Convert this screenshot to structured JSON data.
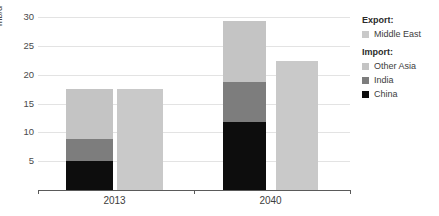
{
  "chart_data": {
    "type": "bar",
    "title": "",
    "subtitle": "",
    "xlabel": "",
    "ylabel": "mb/d",
    "ylim": [
      0,
      30
    ],
    "ytick_labels": [
      "5",
      "10",
      "15",
      "20",
      "25",
      "30"
    ],
    "ytick_values": [
      5,
      10,
      15,
      20,
      25,
      30
    ],
    "grid": true,
    "stacked": true,
    "legend_position": "right",
    "categories": [
      "2013",
      "2040"
    ],
    "groups": [
      {
        "category": "2013",
        "bars": [
          {
            "name": "Import",
            "stacked": true,
            "total": 17.5,
            "segments": [
              {
                "name": "China",
                "value": 5.0,
                "color": "#0d0d0d"
              },
              {
                "name": "India",
                "value": 3.8,
                "color": "#7d7d7d"
              },
              {
                "name": "Other Asia",
                "value": 8.7,
                "color": "#c4c4c4"
              }
            ]
          },
          {
            "name": "Export",
            "stacked": false,
            "total": 17.6,
            "segments": [
              {
                "name": "Middle East",
                "value": 17.6,
                "color": "#c9c9c9"
              }
            ]
          }
        ]
      },
      {
        "category": "2040",
        "bars": [
          {
            "name": "Import",
            "stacked": true,
            "total": 29.3,
            "segments": [
              {
                "name": "China",
                "value": 11.8,
                "color": "#0d0d0d"
              },
              {
                "name": "India",
                "value": 6.9,
                "color": "#7d7d7d"
              },
              {
                "name": "Other Asia",
                "value": 10.6,
                "color": "#c4c4c4"
              }
            ]
          },
          {
            "name": "Export",
            "stacked": false,
            "total": 22.4,
            "segments": [
              {
                "name": "Middle East",
                "value": 22.4,
                "color": "#c9c9c9"
              }
            ]
          }
        ]
      }
    ],
    "series": [
      {
        "name": "China",
        "group": "Import",
        "values": [
          5.0,
          11.8
        ],
        "color": "#0d0d0d"
      },
      {
        "name": "India",
        "group": "Import",
        "values": [
          3.8,
          6.9
        ],
        "color": "#7d7d7d"
      },
      {
        "name": "Other Asia",
        "group": "Import",
        "values": [
          8.7,
          10.6
        ],
        "color": "#c4c4c4"
      },
      {
        "name": "Middle East",
        "group": "Export",
        "values": [
          17.6,
          22.4
        ],
        "color": "#c9c9c9"
      }
    ]
  },
  "legend": {
    "export_heading": "Export:",
    "import_heading": "Import:",
    "export_items": [
      {
        "label": "Middle East",
        "color": "#c9c9c9"
      }
    ],
    "import_items": [
      {
        "label": "Other Asia",
        "color": "#c4c4c4"
      },
      {
        "label": "India",
        "color": "#7d7d7d"
      },
      {
        "label": "China",
        "color": "#0d0d0d"
      }
    ]
  },
  "axis": {
    "y_unit_label": "mb/d",
    "x_labels": [
      "2013",
      "2040"
    ]
  }
}
